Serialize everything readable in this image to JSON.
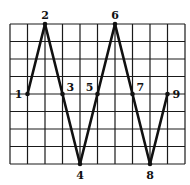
{
  "diagram": {
    "type": "zigzag-on-grid",
    "grid": {
      "columns": 10,
      "rows": 8,
      "x0": 10,
      "y0": 24,
      "cell_w": 17.5,
      "cell_h": 17.5,
      "line_color": "#1a1a1a"
    },
    "path_color": "#111111",
    "points": [
      {
        "label": "1",
        "col": 1,
        "row": 4,
        "label_pos": "left"
      },
      {
        "label": "2",
        "col": 2,
        "row": 0,
        "label_pos": "top"
      },
      {
        "label": "3",
        "col": 3,
        "row": 4,
        "label_pos": "top-right"
      },
      {
        "label": "4",
        "col": 4,
        "row": 8,
        "label_pos": "bottom"
      },
      {
        "label": "5",
        "col": 5,
        "row": 4,
        "label_pos": "top-left"
      },
      {
        "label": "6",
        "col": 6,
        "row": 0,
        "label_pos": "top"
      },
      {
        "label": "7",
        "col": 7,
        "row": 4,
        "label_pos": "top-right"
      },
      {
        "label": "8",
        "col": 8,
        "row": 8,
        "label_pos": "bottom"
      },
      {
        "label": "9",
        "col": 9,
        "row": 4,
        "label_pos": "right"
      }
    ]
  }
}
